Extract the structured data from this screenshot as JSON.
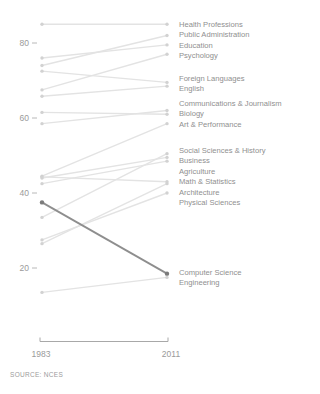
{
  "source_note": "SOURCE: NCES",
  "axis": {
    "x_start_label": "1983",
    "x_end_label": "2011",
    "y_ticks": [
      80,
      60,
      40,
      20
    ]
  },
  "chart_data": {
    "type": "line",
    "subtype": "slopegraph",
    "x": [
      "1983",
      "2011"
    ],
    "title": "",
    "xlabel": "",
    "ylabel": "",
    "ylim": [
      0,
      100
    ],
    "grid": false,
    "legend_position": "right-inline-labels",
    "highlight_series": "Computer Science",
    "series": [
      {
        "name": "Health Professions",
        "values": [
          85,
          85
        ],
        "highlight": false
      },
      {
        "name": "Public Administration",
        "values": [
          74,
          82
        ],
        "highlight": false
      },
      {
        "name": "Education",
        "values": [
          76,
          79.5
        ],
        "highlight": false
      },
      {
        "name": "Psychology",
        "values": [
          67.5,
          77
        ],
        "highlight": false
      },
      {
        "name": "Foreign Languages",
        "values": [
          72.5,
          69.5
        ],
        "highlight": false
      },
      {
        "name": "English",
        "values": [
          65.8,
          68.5
        ],
        "highlight": false
      },
      {
        "name": "Communications & Journalism",
        "values": [
          58.5,
          62
        ],
        "highlight": false
      },
      {
        "name": "Biology",
        "values": [
          44.5,
          58.5
        ],
        "highlight": false
      },
      {
        "name": "Art & Performance",
        "values": [
          61.5,
          61
        ],
        "highlight": false
      },
      {
        "name": "Social Sciences & History",
        "values": [
          44,
          49.5
        ],
        "highlight": false
      },
      {
        "name": "Business",
        "values": [
          42.5,
          48.5
        ],
        "highlight": false
      },
      {
        "name": "Agriculture",
        "values": [
          33.5,
          50.5
        ],
        "highlight": false
      },
      {
        "name": "Math & Statistics",
        "values": [
          44.3,
          43
        ],
        "highlight": false
      },
      {
        "name": "Architecture",
        "values": [
          26.5,
          42.5
        ],
        "highlight": false
      },
      {
        "name": "Physical Sciences",
        "values": [
          27.5,
          40
        ],
        "highlight": false
      },
      {
        "name": "Computer Science",
        "values": [
          37.5,
          18.5
        ],
        "highlight": true
      },
      {
        "name": "Engineering",
        "values": [
          13.5,
          17.5
        ],
        "highlight": false
      }
    ],
    "label_groups": [
      {
        "start_y": 25,
        "labels": [
          "Health Professions",
          "Public Administration",
          "Education",
          "Psychology"
        ]
      },
      {
        "start_y": 79,
        "labels": [
          "Foreign Languages",
          "English"
        ]
      },
      {
        "start_y": 104,
        "labels": [
          "Communications & Journalism",
          "Biology",
          "Art & Performance"
        ]
      },
      {
        "start_y": 151,
        "labels": [
          "Social Sciences & History",
          "Business",
          "Agriculture",
          "Math & Statistics",
          "Architecture",
          "Physical Sciences"
        ]
      },
      {
        "start_y": 273,
        "labels": [
          "Computer Science",
          "Engineering"
        ]
      }
    ],
    "layout_hints": {
      "x_left_px": 42,
      "x_right_px": 167,
      "y_at_80_px": 43,
      "px_per_unit": 3.75,
      "label_line_spacing_px": 10.4,
      "bracket": {
        "y_px": 341.5,
        "tick_up_px": 4,
        "x1_px": 40,
        "x2_px": 168
      }
    },
    "colors": {
      "line": "#e3e3e3",
      "dot": "#d2d2d2",
      "highlight_line": "#8e8e8e",
      "highlight_dot": "#7b7b7b",
      "tick_text": "#9a9a9a",
      "label_text": "#8f8f8f",
      "tick_dash": "#b8b8b8",
      "axis_bracket": "#a8a8a8"
    }
  }
}
